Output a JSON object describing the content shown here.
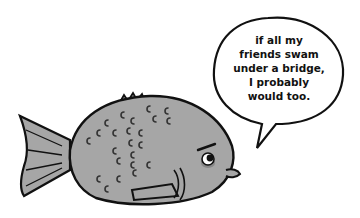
{
  "illustration": {
    "subject": "grumpy gray fish with speech bubble",
    "colors": {
      "fish_body": "#a6a6a6",
      "outline": "#111111",
      "background": "#ffffff",
      "cheek": "#7a7a7a"
    },
    "speech_bubble": {
      "lines": [
        "if all my",
        "friends swam",
        "under a bridge,",
        "I probably",
        "would too."
      ]
    }
  }
}
